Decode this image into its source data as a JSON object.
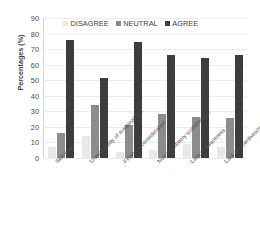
{
  "chart_data": {
    "type": "bar",
    "title": "",
    "subtitle": "",
    "xlabel": "",
    "ylabel": "Percentages (%)",
    "ylim": [
      0,
      90
    ],
    "ytick_step": 10,
    "yticks": [
      "90",
      "80",
      "70",
      "60",
      "50",
      "40",
      "30",
      "20",
      "10",
      "0"
    ],
    "grid": true,
    "grid_axis": "y",
    "legend_position": "top-center",
    "orientation": "vertical",
    "categories": [
      "Skill level",
      "Unavailability of sustainable...",
      "Financial consideration",
      "Non-mandatory sustainable...",
      "Lack of awareness",
      "Lack of incentives/motivation"
    ],
    "series": [
      {
        "name": "DISAGREE",
        "color": "#e8e8e8",
        "values": [
          7,
          14,
          4,
          5,
          9,
          7
        ]
      },
      {
        "name": "NEUTRAL",
        "color": "#8c8c8c",
        "values": [
          16,
          34,
          21,
          28.5,
          26.5,
          25.5
        ]
      },
      {
        "name": "AGREE",
        "color": "#3d3d3d",
        "values": [
          76,
          51.5,
          74.5,
          66,
          64,
          66
        ]
      }
    ]
  },
  "colors": {
    "background": "#ffffff",
    "gridline": "#ececec",
    "axis": "#bdbdbd",
    "text": "#3f3f3f",
    "disagree": "#e8e8e8",
    "neutral": "#8c8c8c",
    "agree": "#3d3d3d"
  }
}
